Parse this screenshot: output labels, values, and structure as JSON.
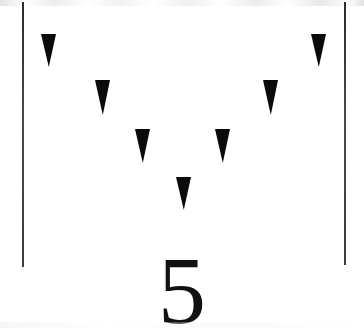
{
  "card": {
    "background_color": "#ffffff",
    "ink_color": "#0b0b0b",
    "width": 364,
    "height": 328,
    "number_label": "5"
  },
  "frame": {
    "rule_color": "#3a3a3a",
    "left_rule": {
      "x": 22,
      "y": 2,
      "height": 265
    },
    "right_rule": {
      "x": 344,
      "y": 2,
      "height": 263
    }
  },
  "markers": {
    "count": 7,
    "shape": "downward-triangle",
    "fill_color": "#0b0b0b",
    "items": [
      {
        "name": "triangle-1",
        "x": 41,
        "y": 34,
        "width": 15,
        "height": 33
      },
      {
        "name": "triangle-2",
        "x": 95,
        "y": 80,
        "width": 15,
        "height": 35
      },
      {
        "name": "triangle-3",
        "x": 135,
        "y": 129,
        "width": 15,
        "height": 34
      },
      {
        "name": "triangle-4",
        "x": 176,
        "y": 177,
        "width": 15,
        "height": 33
      },
      {
        "name": "triangle-5",
        "x": 215,
        "y": 129,
        "width": 15,
        "height": 34
      },
      {
        "name": "triangle-6",
        "x": 263,
        "y": 80,
        "width": 15,
        "height": 35
      },
      {
        "name": "triangle-7",
        "x": 311,
        "y": 34,
        "width": 15,
        "height": 33
      }
    ]
  },
  "chart_data": {
    "type": "scatter",
    "title": "",
    "xlabel": "",
    "ylabel": "",
    "series": [
      {
        "name": "triangle-markers",
        "marker": "triangle-down",
        "x": [
          48,
          102,
          142,
          183,
          222,
          270,
          318
        ],
        "y": [
          34,
          80,
          129,
          177,
          129,
          80,
          34
        ]
      }
    ],
    "xlim": [
      22,
      345
    ],
    "ylim": [
      2,
      267
    ],
    "grid": false,
    "legend": "none",
    "annotations": [
      "5"
    ]
  }
}
